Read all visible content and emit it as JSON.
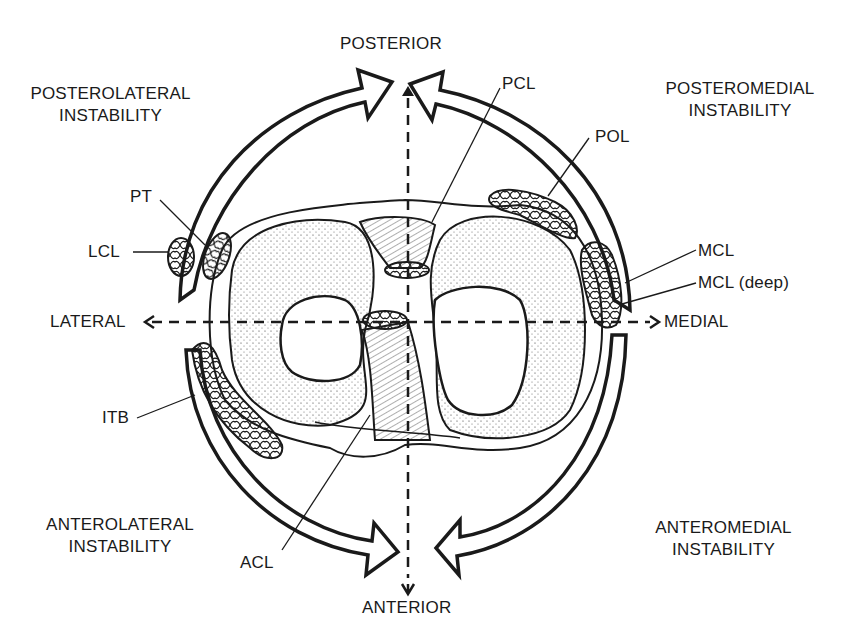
{
  "figure": {
    "type": "anatomical diagram",
    "colors": {
      "ink": "#1a1a1a",
      "background": "#ffffff"
    }
  },
  "directions": {
    "posterior": "POSTERIOR",
    "anterior": "ANTERIOR",
    "lateral": "LATERAL",
    "medial": "MEDIAL"
  },
  "quadrants": {
    "posterolateral": {
      "line1": "POSTEROLATERAL",
      "line2": "INSTABILITY"
    },
    "posteromedial": {
      "line1": "POSTEROMEDIAL",
      "line2": "INSTABILITY"
    },
    "anterolateral": {
      "line1": "ANTEROLATERAL",
      "line2": "INSTABILITY"
    },
    "anteromedial": {
      "line1": "ANTEROMEDIAL",
      "line2": "INSTABILITY"
    }
  },
  "structures": {
    "pcl": "PCL",
    "pol": "POL",
    "pt": "PT",
    "lcl": "LCL",
    "mcl": "MCL",
    "mcl_deep": "MCL (deep)",
    "itb": "ITB",
    "acl": "ACL"
  }
}
